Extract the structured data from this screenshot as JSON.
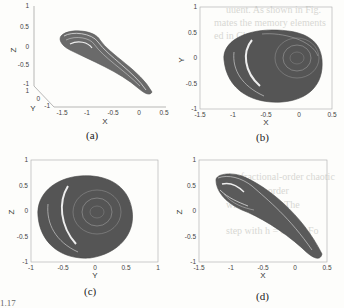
{
  "figure": {
    "panels": [
      {
        "id": "a",
        "caption": "(a)",
        "type": "3d",
        "xlabel": "X",
        "ylabel": "Y",
        "zlabel": "Z",
        "xticks": [
          "-1.5",
          "-1",
          "-0.5",
          "0",
          "0.5"
        ],
        "yticks": [
          "-1",
          "0",
          "1"
        ],
        "zticks": [
          "-1",
          "-0.5",
          "0",
          "0.5",
          "1"
        ]
      },
      {
        "id": "b",
        "caption": "(b)",
        "type": "2d",
        "xlabel": "X",
        "ylabel": "Y",
        "xticks": [
          "-1.5",
          "-1",
          "-0.5",
          "0",
          "0.5"
        ],
        "yticks": [
          "1",
          "0.5",
          "0",
          "-0.5",
          "-1"
        ]
      },
      {
        "id": "c",
        "caption": "(c)",
        "type": "2d",
        "xlabel": "Y",
        "ylabel": "Z",
        "xticks": [
          "-1",
          "-0.5",
          "0",
          "0.5",
          "1"
        ],
        "yticks": [
          "1",
          "0.5",
          "0",
          "-0.5",
          "-1"
        ]
      },
      {
        "id": "d",
        "caption": "(d)",
        "type": "2d",
        "xlabel": "X",
        "ylabel": "Z",
        "xticks": [
          "-1.5",
          "-1",
          "-0.5",
          "0",
          "0.5"
        ],
        "yticks": [
          "1",
          "0.5",
          "0",
          "-0.5",
          "-1"
        ]
      }
    ]
  },
  "bleed_through": {
    "lines_top": [
      "uuent. As shown in Fig.",
      "mates the memory elements",
      "ed in Chapter 3, this"
    ],
    "lines_bottom": [
      "the fractional-order chaotic",
      "fractional-order",
      "with q = 0.01. The",
      "step with h = 0.001. Fo"
    ]
  },
  "footer": "1.17"
}
